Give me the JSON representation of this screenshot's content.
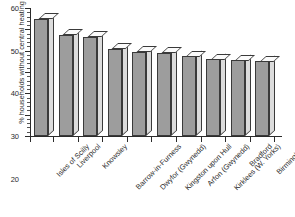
{
  "chart_data": {
    "type": "bar",
    "title": "",
    "subtitle": "",
    "xlabel": "",
    "ylabel": "% households without central heating",
    "ylim": [
      0,
      60
    ],
    "ytick_step": 10,
    "yminor_step": 2,
    "grid": false,
    "legend": null,
    "style": "3d-column",
    "categories": [
      "Isles of Scilly",
      "Liverpool",
      "Knowsley",
      "Barrow-in-Furness",
      "Dwyfor (Gwynedd)",
      "Kingston upon Hull",
      "Arfon (Gwynedd)",
      "Kirklees (W. Yorks)",
      "Bradford",
      "Birmingham"
    ],
    "values": [
      55,
      47.5,
      46.5,
      41,
      39.5,
      39,
      37.5,
      36,
      35.5,
      35
    ],
    "ytick_labels": [
      "0",
      "10",
      "20",
      "30",
      "40",
      "50",
      "60"
    ],
    "ytick_values": [
      0,
      10,
      20,
      30,
      40,
      50,
      60
    ],
    "colors": {
      "bar_front": "#9d9d9d",
      "bar_side": "#dcdcdc",
      "bar_top": "#fbfbfb",
      "outline": "#3a3a3a",
      "axis": "#2b2b2b",
      "background": "#ffffff"
    }
  }
}
